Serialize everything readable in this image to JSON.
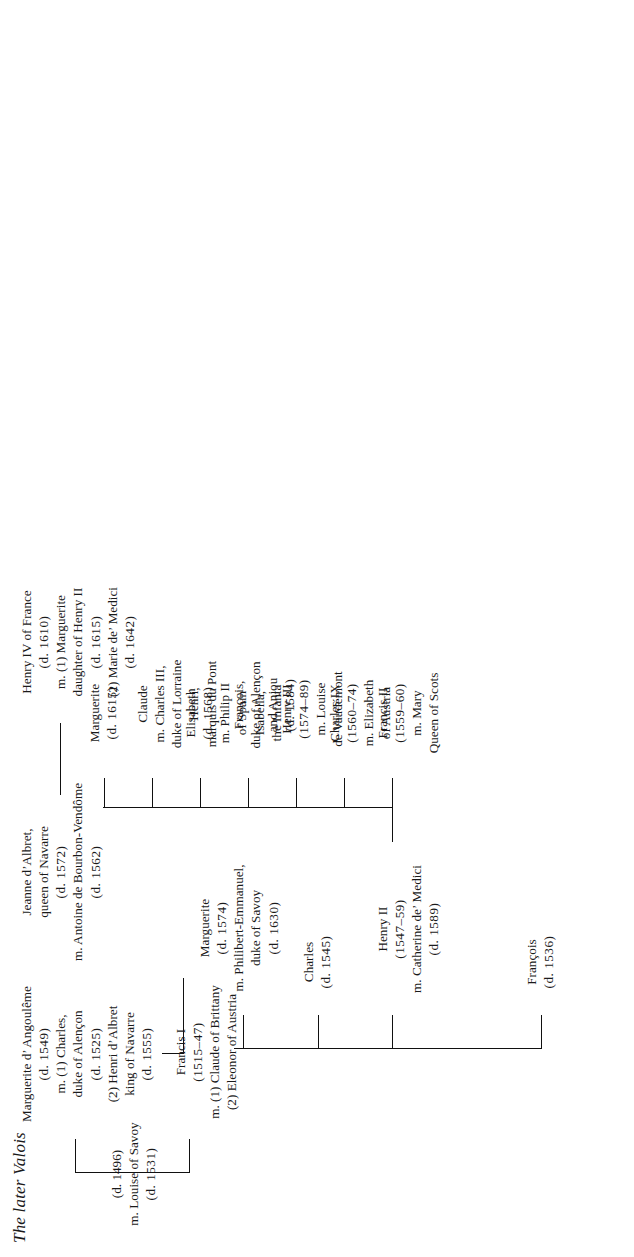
{
  "document": {
    "title": "The later Valois",
    "type": "genealogical-family-tree",
    "orientation": "rotated-90-ccw",
    "ink_color": "#111111",
    "page_color": "#ffffff"
  },
  "nodes": {
    "root_couple": {
      "id": "charles-angouleme-louise-savoy",
      "lines": [
        "(d. 1496)",
        "m. Louise of Savoy",
        "(d. 1531)"
      ]
    },
    "francis_i": {
      "id": "francis-i",
      "lines": [
        "Francis I",
        "(1515–47)",
        "m. (1) Claude of Brittany",
        "(2) Eleonor of Austria"
      ]
    },
    "marguerite_angouleme": {
      "id": "marguerite-d-angouleme",
      "lines": [
        "Marguerite d’ Angoulême",
        "(d. 1549)",
        "m. (1) Charles,",
        "duke of Alençon",
        "(d. 1525)",
        "(2) Henri d’Albret",
        "king of Navarre",
        "(d. 1555)"
      ]
    },
    "jeanne_albret": {
      "id": "jeanne-d-albret",
      "lines": [
        "Jeanne d’Albret,",
        "queen of Navarre",
        "(d. 1572)",
        "m. Antoine de Bourbon-Vendôme",
        "(d. 1562)"
      ]
    },
    "henry_iv": {
      "id": "henry-iv-of-france",
      "lines": [
        "Henry IV of France",
        "(d. 1610)",
        "m. (1) Marguerite",
        "daughter of Henry II",
        "(d. 1615)",
        "(2) Marie de’ Medici",
        "(d. 1642)"
      ]
    },
    "francois_1536": {
      "id": "francois-d-1536",
      "lines": [
        "François",
        "(d. 1536)"
      ]
    },
    "henry_ii": {
      "id": "henry-ii",
      "lines": [
        "Henry II",
        "(1547–59)",
        "m. Catherine de’ Medici",
        "(d. 1589)"
      ]
    },
    "charles_1545": {
      "id": "charles-d-1545",
      "lines": [
        "Charles",
        "(d. 1545)"
      ]
    },
    "marguerite_1574": {
      "id": "marguerite-d-1574",
      "lines": [
        "Marguerite",
        "(d. 1574)",
        "m. Philibert-Emmanuel,",
        "duke of Savoy",
        "(d. 1630)"
      ]
    },
    "francis_ii": {
      "id": "francis-ii",
      "lines": [
        "Francis II",
        "(1559–60)",
        "m. Mary",
        "Queen of Scots"
      ]
    },
    "charles_ix": {
      "id": "charles-ix",
      "lines": [
        "Charles IX",
        "(1560–74)",
        "m. Elizabeth",
        "of Austria"
      ]
    },
    "henry_iii": {
      "id": "henry-iii",
      "lines": [
        "Henry III",
        "(1574–89)",
        "m. Louise",
        "de Vaudémont"
      ]
    },
    "francois_alencon": {
      "id": "francois-duke-of-alencon-and-anjou",
      "lines": [
        "François,",
        "duke of Alençon",
        "and Anjou",
        "(d. 1584)"
      ]
    },
    "elisabeth": {
      "id": "elisabeth",
      "lines": [
        "Elisabeth",
        "(d. 1568)",
        "m. Philip II",
        "of Spain",
        "Isabella,",
        "the Infanta"
      ]
    },
    "claude": {
      "id": "claude",
      "lines": [
        "Claude",
        "m. Charles III,",
        "duke of Lorraine",
        "Henri,",
        "marquis du Pont"
      ]
    },
    "marguerite_1615": {
      "id": "marguerite-d-1615",
      "lines": [
        "Marguerite",
        "(d. 1615)"
      ]
    }
  }
}
